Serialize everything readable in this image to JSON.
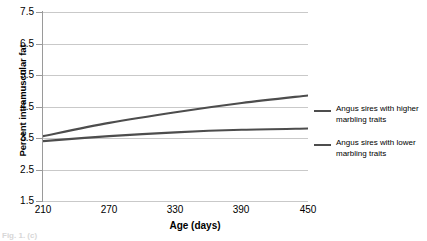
{
  "chart_data": {
    "type": "line",
    "title": "",
    "xlabel": "Age (days)",
    "ylabel": "Percent intramuscular fat",
    "xlim": [
      210,
      450
    ],
    "ylim": [
      1.5,
      7.5
    ],
    "xticks": [
      "210",
      "270",
      "330",
      "390",
      "450"
    ],
    "yticks": [
      "7.5",
      "6.5",
      "5.5",
      "4.5",
      "3.5",
      "2.5",
      "1.5"
    ],
    "grid": true,
    "legend_position": "right",
    "x": [
      210,
      270,
      330,
      390,
      450
    ],
    "series": [
      {
        "name": "Angus sires with higher marbling traits",
        "values": [
          3.56,
          3.98,
          4.32,
          4.61,
          4.85
        ],
        "color": "#4d4d4d"
      },
      {
        "name": "Angus sires with lower marbling traits",
        "values": [
          3.4,
          3.56,
          3.68,
          3.76,
          3.8
        ],
        "color": "#4d4d4d"
      }
    ]
  },
  "axis": {
    "ylabel": "Percent intramuscular fat",
    "xlabel": "Age (days)",
    "yticks": [
      "7.5",
      "6.5",
      "5.5",
      "4.5",
      "3.5",
      "2.5",
      "1.5"
    ],
    "xticks": [
      "210",
      "270",
      "330",
      "390",
      "450"
    ]
  },
  "legend": {
    "entries": [
      {
        "label_line1": "Angus sires with higher",
        "label_line2": "marbling traits",
        "color": "#4d4d4d"
      },
      {
        "label_line1": "Angus sires with lower",
        "label_line2": "marbling traits",
        "color": "#4d4d4d"
      }
    ]
  },
  "caption": {
    "text": "Fig. 1. (c)"
  },
  "colors": {
    "gridline": "#c9c9c9",
    "axis": "#9a9a9a",
    "series": "#4d4d4d",
    "text": "#000000",
    "background": "#ffffff"
  }
}
